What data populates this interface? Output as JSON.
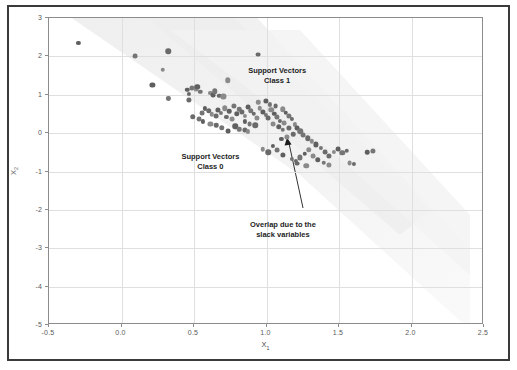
{
  "figure": {
    "background_color": "#ffffff",
    "frame_color": "#3a3a3a",
    "axes_color": "#8c8c8c",
    "grid_color": "#dfdfdf",
    "point_color": "#6b6b6b",
    "margin_band_color": "#f2f2f2"
  },
  "chart_data": {
    "type": "scatter",
    "title": "",
    "xlabel": "X₁",
    "ylabel": "X₂",
    "xlim": [
      -0.5,
      2.5
    ],
    "ylim": [
      -5,
      3
    ],
    "grid": true,
    "legend": "none",
    "xticks": [
      -0.5,
      0.0,
      0.5,
      1.0,
      1.5,
      2.0,
      2.5
    ],
    "xticklabels": [
      "-0.5",
      "0.0",
      "0.5",
      "1.0",
      "1.5",
      "2.0",
      "2.5"
    ],
    "yticks": [
      -5,
      -4,
      -3,
      -2,
      -1,
      0,
      1,
      2,
      3
    ],
    "yticklabels": [
      "-5",
      "-4",
      "-3",
      "-2",
      "-1",
      "0",
      "1",
      "2",
      "3"
    ],
    "annotations": [
      {
        "id": "support-vectors-class-1",
        "lines": [
          "Support Vectors",
          "Class 1"
        ],
        "x": 1.08,
        "y": 1.72
      },
      {
        "id": "support-vectors-class-0",
        "lines": [
          "Support Vectors",
          "Class 0"
        ],
        "x": 0.62,
        "y": -0.52
      },
      {
        "id": "overlap-slack-variables",
        "lines": [
          "Overlap due to the",
          "slack variables"
        ],
        "x": 1.12,
        "y": -2.28,
        "arrow_to": {
          "x": 1.13,
          "y": 0.22
        }
      }
    ],
    "points": [
      [
        -0.29,
        2.32
      ],
      [
        0.1,
        1.98
      ],
      [
        0.33,
        2.11
      ],
      [
        0.29,
        1.62
      ],
      [
        0.22,
        1.22
      ],
      [
        0.33,
        0.88
      ],
      [
        0.95,
        2.02
      ],
      [
        0.74,
        1.35
      ],
      [
        0.46,
        1.1
      ],
      [
        0.49,
        1.16
      ],
      [
        0.47,
        1.0
      ],
      [
        0.52,
        1.12
      ],
      [
        0.53,
        1.18
      ],
      [
        0.55,
        1.05
      ],
      [
        0.47,
        0.84
      ],
      [
        0.62,
        1.03
      ],
      [
        0.64,
        0.97
      ],
      [
        0.65,
        1.06
      ],
      [
        0.68,
        0.95
      ],
      [
        0.71,
        0.93
      ],
      [
        0.58,
        0.62
      ],
      [
        0.56,
        0.5
      ],
      [
        0.61,
        0.55
      ],
      [
        0.63,
        0.47
      ],
      [
        0.67,
        0.58
      ],
      [
        0.69,
        0.5
      ],
      [
        0.66,
        0.42
      ],
      [
        0.72,
        0.62
      ],
      [
        0.75,
        0.55
      ],
      [
        0.78,
        0.68
      ],
      [
        0.73,
        0.4
      ],
      [
        0.77,
        0.35
      ],
      [
        0.8,
        0.48
      ],
      [
        0.82,
        0.6
      ],
      [
        0.84,
        0.52
      ],
      [
        0.86,
        0.42
      ],
      [
        0.88,
        0.66
      ],
      [
        0.9,
        0.56
      ],
      [
        0.92,
        0.48
      ],
      [
        0.94,
        0.36
      ],
      [
        0.86,
        0.28
      ],
      [
        0.89,
        0.22
      ],
      [
        0.93,
        0.18
      ],
      [
        0.96,
        0.62
      ],
      [
        0.98,
        0.52
      ],
      [
        1.0,
        0.44
      ],
      [
        1.02,
        0.36
      ],
      [
        1.04,
        0.58
      ],
      [
        1.06,
        0.48
      ],
      [
        1.08,
        0.4
      ],
      [
        1.1,
        0.3
      ],
      [
        1.05,
        0.22
      ],
      [
        0.79,
        0.15
      ],
      [
        0.82,
        0.08
      ],
      [
        0.86,
        0.05
      ],
      [
        0.88,
        0.02
      ],
      [
        0.74,
        0.02
      ],
      [
        0.7,
        0.12
      ],
      [
        0.66,
        0.18
      ],
      [
        0.62,
        0.22
      ],
      [
        0.57,
        0.28
      ],
      [
        0.54,
        0.34
      ],
      [
        0.5,
        0.4
      ],
      [
        0.95,
        0.78
      ],
      [
        1.0,
        0.82
      ],
      [
        1.03,
        0.72
      ],
      [
        1.07,
        0.68
      ],
      [
        1.12,
        0.6
      ],
      [
        1.14,
        0.5
      ],
      [
        1.16,
        0.42
      ],
      [
        1.18,
        0.34
      ],
      [
        1.13,
        0.24
      ],
      [
        1.09,
        0.14
      ],
      [
        1.12,
        0.06
      ],
      [
        1.16,
        0.12
      ],
      [
        1.2,
        0.2
      ],
      [
        1.22,
        0.1
      ],
      [
        1.24,
        0.02
      ],
      [
        1.19,
        -0.06
      ],
      [
        1.15,
        -0.12
      ],
      [
        1.11,
        -0.18
      ],
      [
        1.26,
        -0.08
      ],
      [
        1.29,
        -0.16
      ],
      [
        1.32,
        -0.24
      ],
      [
        1.35,
        -0.32
      ],
      [
        1.38,
        -0.42
      ],
      [
        1.41,
        -0.52
      ],
      [
        1.3,
        -0.46
      ],
      [
        1.27,
        -0.56
      ],
      [
        1.24,
        -0.66
      ],
      [
        1.21,
        -0.76
      ],
      [
        1.33,
        -0.62
      ],
      [
        1.36,
        -0.72
      ],
      [
        1.4,
        -0.8
      ],
      [
        1.44,
        -0.62
      ],
      [
        1.47,
        -0.52
      ],
      [
        1.5,
        -0.44
      ],
      [
        1.53,
        -0.54
      ],
      [
        1.56,
        -0.48
      ],
      [
        1.44,
        -0.86
      ],
      [
        1.05,
        -0.36
      ],
      [
        1.08,
        -0.46
      ],
      [
        1.02,
        -0.52
      ],
      [
        0.98,
        -0.44
      ],
      [
        1.12,
        -0.6
      ],
      [
        1.18,
        -0.7
      ],
      [
        1.22,
        -0.82
      ],
      [
        1.28,
        -0.88
      ],
      [
        1.7,
        -0.52
      ],
      [
        1.74,
        -0.5
      ],
      [
        1.61,
        -0.82
      ],
      [
        1.58,
        -0.8
      ]
    ]
  }
}
